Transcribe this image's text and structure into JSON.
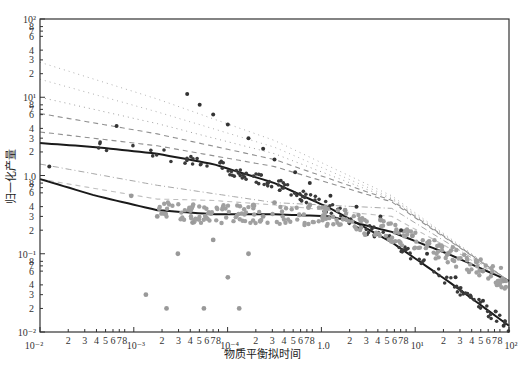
{
  "chart_data": {
    "type": "scatter",
    "title": "",
    "xlabel": "物质平衡拟时间",
    "ylabel": "归一化产量",
    "xscale": "log",
    "yscale": "log",
    "xlim": [
      0.01,
      100
    ],
    "ylim": [
      0.01,
      100
    ],
    "grid": false,
    "legend": null,
    "x_major_tick_labels": [
      "10⁻²",
      "10⁻³",
      "10⁻⁴",
      "1.0",
      "10¹",
      "10²"
    ],
    "x_minor_tick_labels": [
      "2",
      "3",
      "4",
      "5",
      "6",
      "7",
      "8"
    ],
    "y_major_tick_labels": [
      "10²",
      "10¹",
      "1.0",
      "10⁻¹",
      "10⁻²"
    ],
    "y_minor_tick_labels": [
      "8",
      "7",
      "6",
      "4",
      "3",
      "2"
    ],
    "series": [
      {
        "name": "type-curve-1 (dotted)",
        "style": "dotted",
        "color": "#b0b0b0",
        "x": [
          0.01,
          0.1,
          1,
          10,
          100
        ],
        "y": [
          28,
          9.5,
          2.8,
          0.55,
          0.045
        ]
      },
      {
        "name": "type-curve-2 (dotted)",
        "style": "dotted",
        "color": "#b0b0b0",
        "x": [
          0.01,
          0.1,
          1,
          10,
          100
        ],
        "y": [
          17,
          6.5,
          2.3,
          0.52,
          0.045
        ]
      },
      {
        "name": "type-curve-3 (dotted)",
        "style": "dotted",
        "color": "#a0a0a0",
        "x": [
          0.01,
          0.1,
          1,
          10,
          100
        ],
        "y": [
          10,
          4.6,
          1.9,
          0.5,
          0.045
        ]
      },
      {
        "name": "type-curve-4 (dashed)",
        "style": "dashed",
        "color": "#909090",
        "x": [
          0.01,
          0.1,
          1,
          10,
          100
        ],
        "y": [
          6.2,
          3.4,
          1.6,
          0.48,
          0.045
        ]
      },
      {
        "name": "type-curve-5 (dashed)",
        "style": "dashed",
        "color": "#909090",
        "x": [
          0.01,
          0.1,
          1,
          10,
          100
        ],
        "y": [
          3.6,
          2.4,
          1.3,
          0.46,
          0.045
        ]
      },
      {
        "name": "type-curve-6 (dash-dot)",
        "style": "dashdot",
        "color": "#a8a8a8",
        "x": [
          0.01,
          0.1,
          1,
          10,
          100
        ],
        "y": [
          1.4,
          0.75,
          0.45,
          0.38,
          0.045
        ]
      },
      {
        "name": "type-curve-7 (dashed)",
        "style": "dashed",
        "color": "#c0c0c0",
        "x": [
          0.01,
          0.1,
          0.3,
          1,
          10,
          100
        ],
        "y": [
          0.9,
          0.5,
          0.48,
          0.42,
          0.3,
          0.045
        ]
      },
      {
        "name": "fitted-curve-upper",
        "style": "solid",
        "color": "#1a1a1a",
        "x": [
          0.01,
          0.03,
          0.1,
          0.3,
          1,
          3,
          10,
          30,
          100
        ],
        "y": [
          2.6,
          2.3,
          1.9,
          1.4,
          0.8,
          0.38,
          0.14,
          0.045,
          0.012
        ]
      },
      {
        "name": "fitted-curve-lower",
        "style": "solid",
        "color": "#1a1a1a",
        "x": [
          0.01,
          0.03,
          0.1,
          0.3,
          1,
          3,
          10,
          30,
          100
        ],
        "y": [
          0.9,
          0.55,
          0.36,
          0.32,
          0.32,
          0.3,
          0.19,
          0.1,
          0.045
        ]
      },
      {
        "name": "measured-data-dark",
        "style": "markers",
        "color": "#333333",
        "x": [
          0.012,
          0.045,
          0.18,
          0.23,
          0.3,
          0.4,
          0.6,
          0.8,
          1.0,
          1.5,
          2,
          3,
          5,
          8,
          12,
          20,
          35,
          60,
          90
        ],
        "y": [
          1.3,
          4.3,
          11,
          8,
          6,
          4.5,
          3,
          2.2,
          1.6,
          1.1,
          0.8,
          0.55,
          0.4,
          0.3,
          0.2,
          0.1,
          0.05,
          0.025,
          0.012
        ]
      },
      {
        "name": "measured-data-gray",
        "style": "markers",
        "color": "#999999",
        "x": [
          0.06,
          0.08,
          0.1,
          0.12,
          0.15,
          0.2,
          0.25,
          0.3,
          0.4,
          0.5,
          0.6,
          0.8,
          1,
          2,
          4,
          8,
          15,
          30,
          60,
          90
        ],
        "y": [
          0.55,
          0.03,
          0.3,
          0.02,
          0.1,
          0.25,
          0.02,
          0.15,
          0.05,
          0.02,
          0.1,
          0.3,
          0.45,
          0.42,
          0.36,
          0.27,
          0.17,
          0.1,
          0.06,
          0.045
        ]
      }
    ]
  },
  "caption": "物质平衡拟时间"
}
